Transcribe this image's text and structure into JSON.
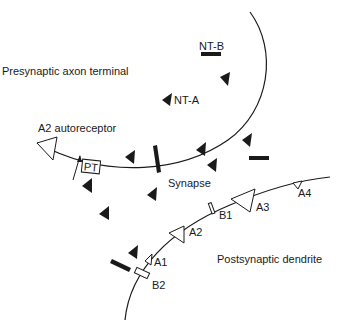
{
  "labels": {
    "presynaptic": "Presynaptic axon terminal",
    "postsynaptic": "Postsynaptic dendrite",
    "synapse": "Synapse",
    "autoreceptor": "A2 autoreceptor",
    "nt_a": "NT-A",
    "nt_b": "NT-B",
    "pt": "PT",
    "a1": "A1",
    "a2": "A2",
    "a3": "A3",
    "a4": "A4",
    "b1": "B1",
    "b2": "B2"
  },
  "colors": {
    "ink": "#1a1a1a",
    "background": "#ffffff"
  }
}
